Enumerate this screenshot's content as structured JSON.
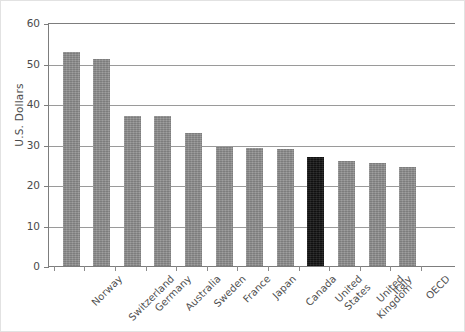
{
  "chart_data": {
    "type": "bar",
    "title": "",
    "xlabel": "",
    "ylabel": "U.S. Dollars",
    "ylim": [
      0,
      60
    ],
    "yticks": [
      0,
      10,
      20,
      30,
      40,
      50,
      60
    ],
    "grid": true,
    "legend": null,
    "categories": [
      "Norway",
      "Switzerland",
      "Germany",
      "Australia",
      "Sweden",
      "France",
      "Japan",
      "Canada",
      "United\nStates",
      "United\nKingdom",
      "Italy",
      "OECD"
    ],
    "values": [
      53.0,
      51.4,
      37.4,
      37.4,
      33.1,
      29.6,
      29.4,
      29.2,
      27.1,
      26.2,
      25.8,
      24.6
    ],
    "bar_colors": [
      "#8c8c8c",
      "#8c8c8c",
      "#8c8c8c",
      "#8c8c8c",
      "#8c8c8c",
      "#8c8c8c",
      "#8c8c8c",
      "#8c8c8c",
      "#151515",
      "#8c8c8c",
      "#8c8c8c",
      "#8c8c8c"
    ],
    "highlight_index": 8,
    "colors": {
      "bar_default": "#8c8c8c",
      "bar_highlight": "#151515",
      "axis": "#7d7d7d",
      "grid": "#9a9a9a",
      "text": "#4a4a4a",
      "background": "#ffffff"
    }
  }
}
